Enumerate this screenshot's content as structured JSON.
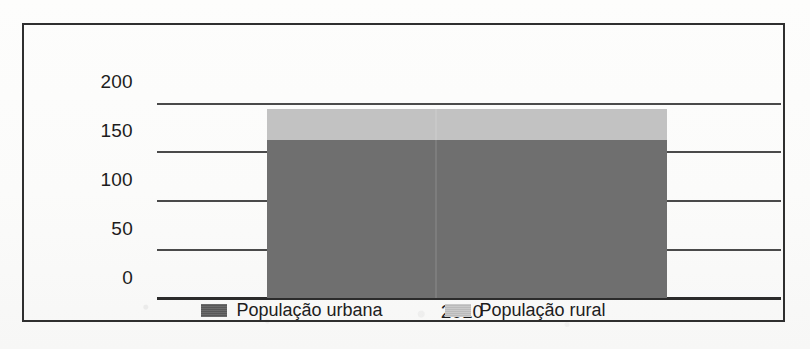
{
  "chart_data": {
    "type": "bar",
    "subtype": "stacked-bar",
    "title": "",
    "xlabel": "",
    "ylabel": "(em milhões)",
    "categories": [
      "2010"
    ],
    "series": [
      {
        "name": "População urbana",
        "values": [
          162
        ],
        "color": "#6f6f6f"
      },
      {
        "name": "População rural",
        "values": [
          32
        ],
        "color": "#c2c2c2"
      }
    ],
    "stack_totals": [
      194
    ],
    "ylim": [
      0,
      200
    ],
    "yticks": [
      0,
      50,
      100,
      150,
      200
    ],
    "ytick_labels": [
      "0",
      "50",
      "100",
      "150",
      "200"
    ],
    "grid": true,
    "legend_position": "bottom"
  },
  "axis": {
    "y_title": "(em milhões)",
    "y_ticks": [
      {
        "label": "200",
        "value": 200
      },
      {
        "label": "150",
        "value": 150
      },
      {
        "label": "100",
        "value": 100
      },
      {
        "label": "50",
        "value": 50
      },
      {
        "label": "0",
        "value": 0
      }
    ],
    "x_ticks": [
      {
        "label": "2010"
      }
    ]
  },
  "legend": {
    "items": [
      {
        "label": "População urbana",
        "color": "#5f5f5f",
        "swatch": "legend-swatch-urbana"
      },
      {
        "label": "População rural",
        "color": "#c4c4c4",
        "swatch": "legend-swatch-rural"
      }
    ]
  },
  "colors": {
    "urbana": "#6f6f6f",
    "rural": "#c2c2c2",
    "gridline": "#4a4a4a",
    "axis": "#2b2b2b",
    "frame": "#2f2f2f",
    "paper": "#fdfdfc",
    "text": "#1d1d1d"
  }
}
